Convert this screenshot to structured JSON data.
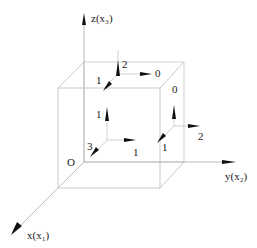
{
  "diagram": {
    "type": "3d-stress-cube",
    "colors": {
      "edge": "#c8c8c8",
      "axis": "#c0c0c0",
      "arrow": "#111111",
      "text": "#222222"
    },
    "axes": {
      "z": "z(x₃)",
      "y": "y(x₂)",
      "x": "x(x₁)",
      "origin": "O"
    },
    "faces": {
      "top": {
        "z_component": "2",
        "x_component": "1",
        "y_component": "0"
      },
      "right": {
        "z_component": "0",
        "x_component": "1",
        "y_component": "2"
      },
      "front": {
        "z_component": "1",
        "x_component": "3",
        "y_component": "1"
      }
    }
  }
}
